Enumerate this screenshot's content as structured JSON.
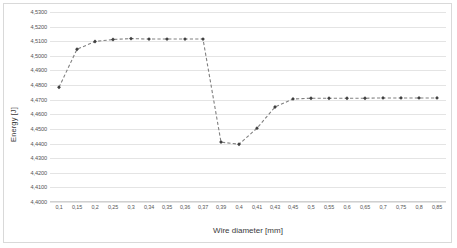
{
  "chart_data": {
    "type": "line",
    "title": "",
    "xlabel": "Wire diameter [mm]",
    "ylabel": "Energy [J]",
    "categories": [
      "0,1",
      "0,15",
      "0,2",
      "0,25",
      "0,3",
      "0,34",
      "0,35",
      "0,36",
      "0,37",
      "0,39",
      "0,4",
      "0,41",
      "0,43",
      "0,45",
      "0,5",
      "0,55",
      "0,6",
      "0,65",
      "0,7",
      "0,75",
      "0,8",
      "0,85"
    ],
    "values": [
      4.4785,
      4.5045,
      4.5098,
      4.5112,
      4.5118,
      4.5115,
      4.5115,
      4.5115,
      4.5115,
      4.441,
      4.4395,
      4.4505,
      4.465,
      4.4705,
      4.471,
      4.471,
      4.471,
      4.471,
      4.4712,
      4.4712,
      4.4712,
      4.4712
    ],
    "series": [
      {
        "name": "Energy",
        "values": [
          4.4785,
          4.5045,
          4.5098,
          4.5112,
          4.5118,
          4.5115,
          4.5115,
          4.5115,
          4.5115,
          4.441,
          4.4395,
          4.4505,
          4.465,
          4.4705,
          4.471,
          4.471,
          4.471,
          4.471,
          4.4712,
          4.4712,
          4.4712,
          4.4712
        ],
        "line_color": "#808080",
        "line_style": "dashed",
        "marker": "diamond",
        "marker_color": "#404040"
      }
    ],
    "ylim": [
      4.4,
      4.53
    ],
    "y_ticks": [
      "4,5300",
      "4,5200",
      "4,5100",
      "4,5000",
      "4,4900",
      "4,4800",
      "4,4700",
      "4,4600",
      "4,4500",
      "4,4400",
      "4,4300",
      "4,4200",
      "4,4100",
      "4,4000"
    ],
    "y_tick_values": [
      4.53,
      4.52,
      4.51,
      4.5,
      4.49,
      4.48,
      4.47,
      4.46,
      4.45,
      4.44,
      4.43,
      4.42,
      4.41,
      4.4
    ],
    "grid": true,
    "grid_color": "#e4e4e4",
    "legend": false,
    "legend_position": "none",
    "plot_background": "#ffffff",
    "border_color": "#d9d9d9",
    "decimal_separator": ","
  }
}
